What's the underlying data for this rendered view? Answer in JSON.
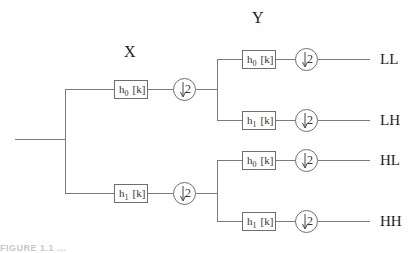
{
  "diagram": {
    "type": "two-level 2D wavelet analysis filter bank",
    "stage_labels": {
      "first": "X",
      "second": "Y"
    },
    "filters": {
      "lowpass": {
        "h": "h",
        "sub": "0",
        "arg": "[k]"
      },
      "highpass": {
        "h": "h",
        "sub": "1",
        "arg": "[k]"
      }
    },
    "downsampler": {
      "symbol": "↓",
      "factor": "2"
    },
    "outputs": [
      "LL",
      "LH",
      "HL",
      "HH"
    ],
    "caption": "FIGURE 1.1  ..."
  }
}
